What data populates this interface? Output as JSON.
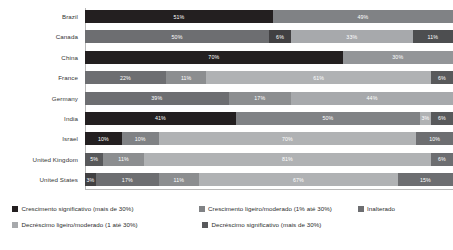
{
  "chart_data": {
    "type": "bar",
    "subtype": "horizontal-100-percent-stacked",
    "title": "",
    "xlabel": "",
    "ylabel": "",
    "xlim": [
      0,
      100
    ],
    "grid": false,
    "legend_position": "bottom-left",
    "categories": [
      "Brazil",
      "Canada",
      "China",
      "France",
      "Germany",
      "India",
      "Israel",
      "United Kingdom",
      "United States"
    ],
    "series": [
      {
        "name": "Crescimento significativo (mais de 30%)",
        "color": "#231f20",
        "values": [
          51,
          0,
          70,
          22,
          0,
          41,
          10,
          5,
          3
        ]
      },
      {
        "name": "Crescimento ligeiro/moderado (1% até 30%)",
        "color": "#6d6e71",
        "values": [
          49,
          50,
          30,
          11,
          39,
          50,
          10,
          11,
          17
        ]
      },
      {
        "name": "Inalterado",
        "color": "#a7a9ac",
        "values": [
          0,
          6,
          0,
          61,
          17,
          0,
          70,
          81,
          11
        ]
      },
      {
        "name": "Decréscimo ligeiro/moderado (1 até 30%)",
        "color": "#d1d3d4",
        "values": [
          0,
          33,
          0,
          0,
          44,
          3,
          0,
          0,
          67
        ]
      },
      {
        "name": "Decréscimo significativo (mais de 30%)",
        "color": "#58595b",
        "values": [
          0,
          11,
          0,
          6,
          0,
          6,
          10,
          6,
          15
        ]
      }
    ],
    "rows": [
      {
        "label": "Brazil",
        "segments": [
          {
            "series": "Crescimento significativo (mais de 30%)",
            "value": 51,
            "label": "51%",
            "color": "#231f20"
          },
          {
            "series": "Crescimento ligeiro/moderado (1% até 30%)",
            "value": 49,
            "label": "49%",
            "color": "#808285"
          }
        ]
      },
      {
        "label": "Canada",
        "segments": [
          {
            "series": "Crescimento ligeiro/moderado (1% até 30%)",
            "value": 50,
            "label": "50%",
            "color": "#6d6e71"
          },
          {
            "series": "Crescimento significativo (mais de 30%)",
            "value": 6,
            "label": "6%",
            "color": "#414042"
          },
          {
            "series": "Inalterado",
            "value": 33,
            "label": "33%",
            "color": "#a7a9ac"
          },
          {
            "series": "Decréscimo significativo (mais de 30%)",
            "value": 11,
            "label": "11%",
            "color": "#4d4e50"
          }
        ]
      },
      {
        "label": "China",
        "segments": [
          {
            "series": "Crescimento significativo (mais de 30%)",
            "value": 70,
            "label": "70%",
            "color": "#231f20"
          },
          {
            "series": "Crescimento ligeiro/moderado (1% até 30%)",
            "value": 30,
            "label": "30%",
            "color": "#939598"
          }
        ]
      },
      {
        "label": "France",
        "segments": [
          {
            "series": "Crescimento significativo (mais de 30%)",
            "value": 22,
            "label": "22%",
            "color": "#6d6e71"
          },
          {
            "series": "Crescimento ligeiro/moderado (1% até 30%)",
            "value": 11,
            "label": "11%",
            "color": "#8c8e90"
          },
          {
            "series": "Inalterado",
            "value": 61,
            "label": "61%",
            "color": "#b0b2b4"
          },
          {
            "series": "Decréscimo significativo (mais de 30%)",
            "value": 6,
            "label": "6%",
            "color": "#58595b"
          }
        ]
      },
      {
        "label": "Germany",
        "segments": [
          {
            "series": "Crescimento significativo (mais de 30%)",
            "value": 39,
            "label": "39%",
            "color": "#6d6e71"
          },
          {
            "series": "Crescimento ligeiro/moderado (1% até 30%)",
            "value": 17,
            "label": "17%",
            "color": "#8c8e90"
          },
          {
            "series": "Inalterado",
            "value": 44,
            "label": "44%",
            "color": "#a7a9ac"
          }
        ]
      },
      {
        "label": "India",
        "segments": [
          {
            "series": "Crescimento significativo (mais de 30%)",
            "value": 41,
            "label": "41%",
            "color": "#231f20"
          },
          {
            "series": "Crescimento ligeiro/moderado (1% até 30%)",
            "value": 50,
            "label": "50%",
            "color": "#808285"
          },
          {
            "series": "Inalterado",
            "value": 3,
            "label": "3%",
            "color": "#b0b2b4"
          },
          {
            "series": "Decréscimo significativo (mais de 30%)",
            "value": 6,
            "label": "6%",
            "color": "#58595b"
          }
        ]
      },
      {
        "label": "Israel",
        "segments": [
          {
            "series": "Crescimento significativo (mais de 30%)",
            "value": 10,
            "label": "10%",
            "color": "#231f20"
          },
          {
            "series": "Crescimento ligeiro/moderado (1% até 30%)",
            "value": 10,
            "label": "10%",
            "color": "#808285"
          },
          {
            "series": "Inalterado",
            "value": 70,
            "label": "70%",
            "color": "#b0b2b4"
          },
          {
            "series": "Decréscimo significativo (mais de 30%)",
            "value": 10,
            "label": "10%",
            "color": "#6d6e71"
          }
        ]
      },
      {
        "label": "United Kingdom",
        "segments": [
          {
            "series": "Crescimento significativo (mais de 30%)",
            "value": 5,
            "label": "5%",
            "color": "#58595b"
          },
          {
            "series": "Crescimento ligeiro/moderado (1% até 30%)",
            "value": 11,
            "label": "11%",
            "color": "#8c8e90"
          },
          {
            "series": "Inalterado",
            "value": 78,
            "label": "81%",
            "color": "#b0b2b4"
          },
          {
            "series": "Decréscimo significativo (mais de 30%)",
            "value": 6,
            "label": "6%",
            "color": "#6d6e71"
          }
        ]
      },
      {
        "label": "United States",
        "segments": [
          {
            "series": "Crescimento significativo (mais de 30%)",
            "value": 3,
            "label": "3%",
            "color": "#414042"
          },
          {
            "series": "Crescimento ligeiro/moderado (1% até 30%)",
            "value": 17,
            "label": "17%",
            "color": "#6d6e71"
          },
          {
            "series": "Inalterado",
            "value": 11,
            "label": "11%",
            "color": "#8c8e90"
          },
          {
            "series": "Decréscimo ligeiro/moderado (1 até 30%)",
            "value": 54,
            "label": "67%",
            "color": "#b0b2b4"
          },
          {
            "series": "Decréscimo significativo (mais de 30%)",
            "value": 15,
            "label": "15%",
            "color": "#6d6e71"
          }
        ]
      }
    ]
  },
  "legend": {
    "items": [
      {
        "label": "Crescimento significativo (mais de 30%)",
        "color": "#231f20"
      },
      {
        "label": "Crescimento ligeiro/moderado (1% até 30%)",
        "color": "#808285"
      },
      {
        "label": "Inalterado",
        "color": "#6d6e71"
      },
      {
        "label": "Decréscimo ligeiro/moderado (1 até 30%)",
        "color": "#a7a9ac"
      },
      {
        "label": "Decréscimo significativo (mais de 30%)",
        "color": "#58595b"
      }
    ]
  }
}
